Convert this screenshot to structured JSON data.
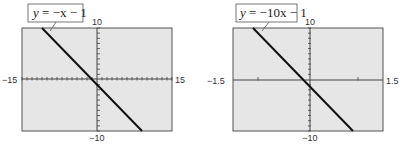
{
  "chart_data": [
    {
      "type": "line",
      "title": "y = −x − 1",
      "equation": {
        "slope": -1,
        "intercept": -1
      },
      "xlim": [
        -15,
        15
      ],
      "ylim": [
        -10,
        10
      ],
      "x_tick_step": 1,
      "y_tick_step": 1,
      "labels": {
        "xmin": "−15",
        "xmax": "15",
        "ymin": "−10",
        "ymax": "10"
      },
      "grid": false,
      "background": "#e6e6e6"
    },
    {
      "type": "line",
      "title": "y = −10x − 1",
      "equation": {
        "slope": -10,
        "intercept": -1
      },
      "xlim": [
        -1.5,
        1.5
      ],
      "ylim": [
        -10,
        10
      ],
      "x_tick_step": 1,
      "y_tick_step": 1,
      "labels": {
        "xmin": "−1.5",
        "xmax": "1.5",
        "ymin": "−10",
        "ymax": "10"
      },
      "grid": false,
      "background": "#e6e6e6"
    }
  ],
  "graphs": [
    {
      "label_prefix": "y",
      "label_rest": " = −x − 1",
      "xmin": "−15",
      "xmax": "15",
      "ymin": "−10",
      "ymax": "10"
    },
    {
      "label_prefix": "y",
      "label_rest": " = −10x − 1",
      "xmin": "−1.5",
      "xmax": "1.5",
      "ymin": "−10",
      "ymax": "10"
    }
  ],
  "colors": {
    "screen": "#e6e6e6",
    "frame": "#555555",
    "line": "#111111",
    "axis": "#444444"
  }
}
